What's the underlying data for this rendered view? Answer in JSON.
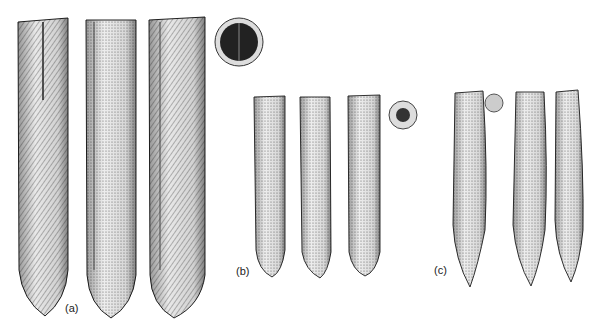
{
  "figure": {
    "groups": [
      {
        "label": "(a)",
        "specimens": 3,
        "has_cross_section": true
      },
      {
        "label": "(b)",
        "specimens": 3,
        "has_cross_section": true
      },
      {
        "label": "(c)",
        "specimens": 3,
        "has_cross_section": true
      }
    ]
  }
}
